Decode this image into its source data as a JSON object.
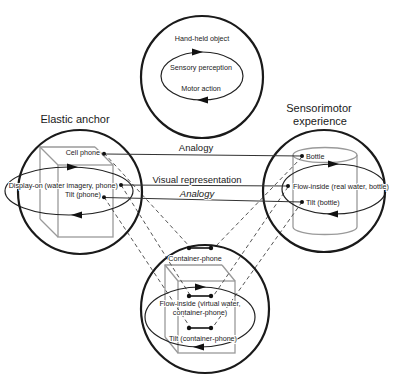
{
  "figure": {
    "regions": {
      "top_circle": {
        "label": "Hand-held object",
        "cycle_top": "Sensory perception",
        "cycle_bottom": "Motor action"
      },
      "left_circle": {
        "title": "Elastic anchor",
        "items": [
          {
            "label": "Cell phone"
          },
          {
            "label": "Display-on (water imagery, phone)"
          },
          {
            "label": "Tilt (phone)"
          }
        ]
      },
      "right_circle": {
        "title_line1": "Sensorimotor",
        "title_line2": "experience",
        "items": [
          {
            "label": "Bottle"
          },
          {
            "label": "Flow-inside (real water, bottle)"
          },
          {
            "label": "Tilt (bottle)"
          }
        ]
      },
      "bottom_circle": {
        "items": [
          {
            "label": "Container-phone"
          },
          {
            "label_line1": "Flow-inside (virtual water,",
            "label_line2": "container-phone)"
          },
          {
            "label": "Tilt (container-phone)"
          }
        ]
      }
    },
    "connectors": {
      "analogy_top": "Analogy",
      "visual_representation": "Visual representation",
      "analogy_bottom": "Analogy"
    },
    "colors": {
      "ink": "#1a1a1a",
      "shape_gray": "#9a9a9a",
      "dashed_line": "#555555",
      "background": "#ffffff"
    }
  }
}
